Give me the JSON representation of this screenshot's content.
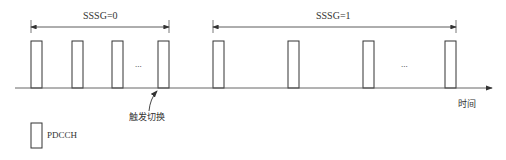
{
  "diagram": {
    "periods": [
      {
        "label": "SSSG=0",
        "x_start": 31,
        "x_end": 169
      },
      {
        "label": "SSSG=1",
        "x_start": 213,
        "x_end": 456
      }
    ],
    "pdcch_boxes_x": [
      31,
      72,
      112,
      158,
      213,
      288,
      363,
      445
    ],
    "ellipsis": [
      {
        "text": "...",
        "x": 138
      },
      {
        "text": "...",
        "x": 405
      }
    ],
    "trigger_label": "触发切换",
    "time_axis_label": "时间",
    "legend": {
      "label": "PDCCH"
    }
  }
}
